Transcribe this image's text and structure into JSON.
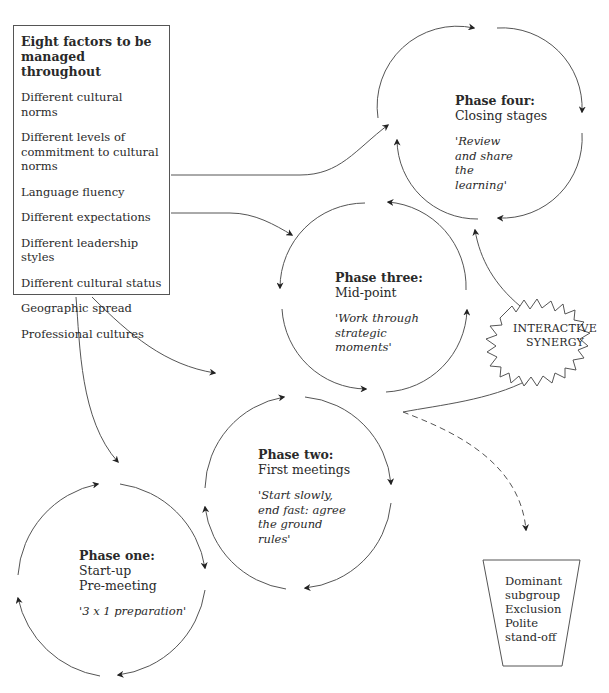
{
  "factors_box": {
    "title": "Eight factors to be managed throughout",
    "items": [
      "Different cultural norms",
      "Different levels of commitment to cultural norms",
      "Language fluency",
      "Different expectations",
      "Different leadership styles",
      "Different cultural status",
      "Geographic spread",
      "Professional cultures"
    ]
  },
  "phases": {
    "one": {
      "title": "Phase one:",
      "lines": [
        "Start-up",
        "Pre-meeting"
      ],
      "quote": "'3 x 1 preparation'"
    },
    "two": {
      "title": "Phase two:",
      "lines": [
        "First meetings"
      ],
      "quote": "'Start slowly, end fast: agree the ground rules'"
    },
    "three": {
      "title": "Phase three:",
      "lines": [
        "Mid-point"
      ],
      "quote": "'Work through strategic moments'"
    },
    "four": {
      "title": "Phase four:",
      "lines": [
        "Closing stages"
      ],
      "quote": "'Review and share the learning'"
    }
  },
  "synergy": {
    "line1": "INTERACTIVE",
    "line2": "SYNERGY"
  },
  "outcome_box": {
    "lines": [
      "Dominant",
      "subgroup",
      "Exclusion",
      "Polite",
      "stand-off"
    ]
  },
  "colors": {
    "stroke": "#444444",
    "text": "#2a2a2a",
    "background": "#ffffff"
  }
}
